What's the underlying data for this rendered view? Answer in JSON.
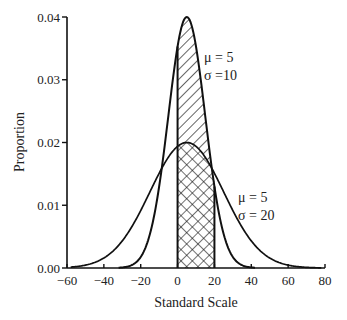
{
  "chart_data": {
    "type": "line",
    "title": "",
    "xlabel": "Standard Scale",
    "ylabel": "Proportion",
    "xlim": [
      -60,
      80
    ],
    "ylim": [
      0,
      0.04
    ],
    "x_ticks": [
      -60,
      -40,
      -20,
      0,
      20,
      40,
      60,
      80
    ],
    "x_tick_labels": [
      "−60",
      "−40",
      "−20",
      "0",
      "20",
      "40",
      "60",
      "80"
    ],
    "y_ticks": [
      0,
      0.01,
      0.02,
      0.03,
      0.04
    ],
    "y_tick_labels": [
      "0.00",
      "0.01",
      "0.02",
      "0.03",
      "0.04"
    ],
    "grid": false,
    "legend": null,
    "series": [
      {
        "name": "μ = 5, σ = 10",
        "distribution": "normal",
        "mu": 5,
        "sigma": 10,
        "peak": 0.04,
        "shaded_region": [
          0,
          20
        ],
        "shading": "diagonal-hatch"
      },
      {
        "name": "μ = 5, σ = 20",
        "distribution": "normal",
        "mu": 5,
        "sigma": 20,
        "peak": 0.02,
        "shaded_region": [
          0,
          20
        ],
        "shading": "cross-hatch"
      }
    ],
    "annotations": [
      {
        "line1": "μ = 5",
        "line2": "σ =10",
        "x": 242,
        "y": 55
      },
      {
        "line1": "μ = 5",
        "line2": "σ = 20",
        "x": 240,
        "y": 200
      }
    ]
  },
  "layout": {
    "plot_left": 67,
    "plot_right": 325,
    "plot_top": 17,
    "plot_bottom": 268,
    "line_color": "#111111"
  }
}
